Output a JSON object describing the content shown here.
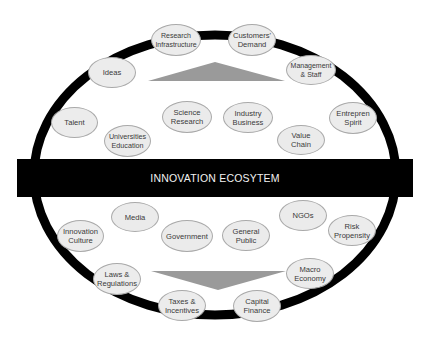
{
  "title": "INNOVATION ECOSYTEM",
  "colors": {
    "ring": "#000000",
    "node_fill": "#ececec",
    "node_border": "#a9a9a9",
    "band": "#000000",
    "band_text": "#f2f2f2",
    "triangle": "#9a9a9a"
  },
  "outer_nodes": [
    {
      "id": "research-infrastructure",
      "label": "Research\nInfrastructure"
    },
    {
      "id": "customers-demand",
      "label": "Customers'\nDemand"
    },
    {
      "id": "management-staff",
      "label": "Management\n& Staff"
    },
    {
      "id": "entrepren-spirit",
      "label": "Entrepren\nSpirit"
    },
    {
      "id": "risk-propensity",
      "label": "Risk\nPropensity"
    },
    {
      "id": "macro-economy",
      "label": "Macro\nEconomy"
    },
    {
      "id": "capital-finance",
      "label": "Capital\nFinance"
    },
    {
      "id": "taxes-incentives",
      "label": "Taxes &\nIncentives"
    },
    {
      "id": "laws-regulations",
      "label": "Laws &\nRegulations"
    },
    {
      "id": "innovation-culture",
      "label": "Innovation\nCulture"
    },
    {
      "id": "talent",
      "label": "Talent"
    },
    {
      "id": "ideas",
      "label": "Ideas"
    }
  ],
  "upper_inner_nodes": [
    {
      "id": "science-research",
      "label": "Science\nResearch"
    },
    {
      "id": "industry-business",
      "label": "Industry\nBusiness"
    },
    {
      "id": "universities-education",
      "label": "Universities\nEducation"
    },
    {
      "id": "value-chain",
      "label": "Value\nChain"
    }
  ],
  "lower_inner_nodes": [
    {
      "id": "media",
      "label": "Media"
    },
    {
      "id": "ngos",
      "label": "NGOs"
    },
    {
      "id": "government",
      "label": "Government"
    },
    {
      "id": "general-public",
      "label": "General\nPublic"
    }
  ]
}
